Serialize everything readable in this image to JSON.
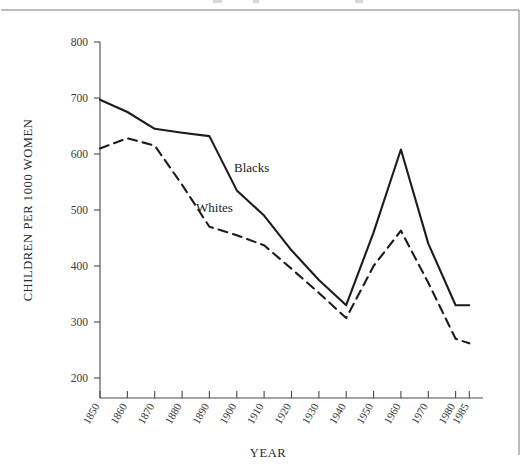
{
  "figure": {
    "background_color": "#ffffff",
    "line_color": "#1c1c1c",
    "axis_color": "#4a4a4a",
    "border_color": "#7a7a7a"
  },
  "chart_data": {
    "type": "line",
    "title": "",
    "xlabel": "YEAR",
    "ylabel": "CHILDREN PER 1000 WOMEN",
    "x": [
      1850,
      1860,
      1870,
      1880,
      1890,
      1900,
      1910,
      1920,
      1930,
      1940,
      1950,
      1960,
      1970,
      1980,
      1985
    ],
    "xtick_labels": [
      "1850",
      "1860",
      "1870",
      "1880",
      "1890",
      "1900",
      "1910",
      "1920",
      "1930",
      "1940",
      "1950",
      "1960",
      "1970",
      "1980",
      "1985"
    ],
    "ytick_labels": [
      "200",
      "300",
      "400",
      "500",
      "600",
      "700",
      "800"
    ],
    "yticks": [
      200,
      300,
      400,
      500,
      600,
      700,
      800
    ],
    "ylim": [
      200,
      800
    ],
    "xlim": [
      1850,
      1985
    ],
    "grid": false,
    "legend_position": "inline-annotation",
    "series": [
      {
        "name": "Blacks",
        "style": "solid",
        "label_text": "Blacks",
        "values": [
          697,
          675,
          645,
          638,
          632,
          535,
          490,
          428,
          375,
          330,
          460,
          608,
          440,
          330,
          330
        ]
      },
      {
        "name": "Whites",
        "style": "dashed",
        "label_text": "Whites",
        "values": [
          610,
          628,
          615,
          545,
          470,
          455,
          437,
          395,
          352,
          307,
          400,
          463,
          370,
          270,
          262
        ]
      }
    ],
    "annotations": [
      {
        "text": "Blacks",
        "x_px": 234,
        "y_px": 172
      },
      {
        "text": "Whites",
        "x_px": 196,
        "y_px": 212
      }
    ]
  }
}
